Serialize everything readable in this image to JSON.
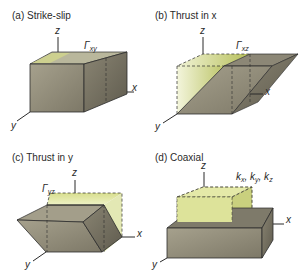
{
  "panels": [
    {
      "id": "a",
      "title": "(a) Strike-slip",
      "label_main": "Γ",
      "label_sub": "xy",
      "axes": {
        "x": "x",
        "y": "y",
        "z": "z"
      }
    },
    {
      "id": "b",
      "title": "(b) Thrust in x",
      "label_main": "Γ",
      "label_sub": "xz",
      "axes": {
        "x": "x",
        "y": "y",
        "z": "z"
      }
    },
    {
      "id": "c",
      "title": "(c) Thrust in y",
      "label_main": "Γ",
      "label_sub": "yz",
      "axes": {
        "x": "x",
        "y": "y",
        "z": "z"
      }
    },
    {
      "id": "d",
      "title": "(d) Coaxial",
      "label_main": "k",
      "label_sub": "x",
      "label_full": "kx, ky, kz",
      "axes": {
        "x": "x",
        "y": "y",
        "z": "z"
      }
    }
  ],
  "colors": {
    "block_front": "#8f8a78",
    "block_side": "#6e6a5c",
    "top_green": "#c8cf7a",
    "ghost_green": "#e6ecb8",
    "line": "#2b2b2b"
  }
}
